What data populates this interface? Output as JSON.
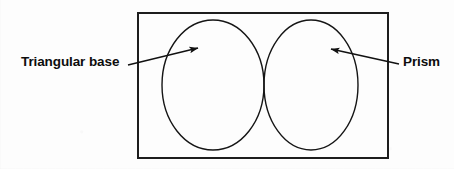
{
  "diagram": {
    "type": "venn-diagram",
    "title": "",
    "canvas": {
      "width": 454,
      "height": 169
    },
    "background_color": "#fdfdfd",
    "stroke_color": "#1a1a1a",
    "frame": {
      "name": "universal-set-rectangle",
      "x": 138,
      "y": 13,
      "width": 250,
      "height": 145,
      "stroke_width": 2
    },
    "circles": [
      {
        "name": "left-circle",
        "label": "Triangular base",
        "cx": 213,
        "cy": 85,
        "rx": 51,
        "ry": 65,
        "stroke_width": 1.4
      },
      {
        "name": "right-circle",
        "label": "Prism",
        "cx": 311,
        "cy": 85,
        "rx": 47,
        "ry": 65,
        "stroke_width": 1.4
      }
    ],
    "labels": [
      {
        "id": "triangular-base",
        "text": "Triangular base",
        "x": 21,
        "y": 55,
        "bold": true,
        "color": "#0d0d0d"
      },
      {
        "id": "prism",
        "text": "Prism",
        "x": 403,
        "y": 55,
        "bold": true,
        "color": "#0d0d0d"
      }
    ],
    "arrows": [
      {
        "name": "arrow-to-left-circle",
        "from_label": "Triangular base",
        "tail_x": 128,
        "tail_y": 65,
        "head_x": 198,
        "head_y": 48,
        "direction": "right",
        "stroke_width": 1.4
      },
      {
        "name": "arrow-to-right-circle",
        "from_label": "Prism",
        "tail_x": 399,
        "tail_y": 64,
        "head_x": 331,
        "head_y": 49,
        "direction": "left",
        "stroke_width": 1.4
      }
    ]
  }
}
